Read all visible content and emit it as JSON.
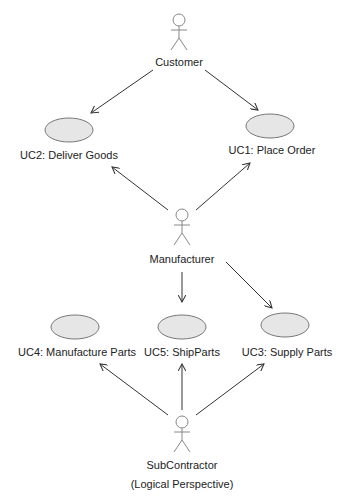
{
  "diagram": {
    "type": "uml-use-case",
    "actors": [
      {
        "id": "customer",
        "label": "Customer"
      },
      {
        "id": "manufacturer",
        "label": "Manufacturer"
      },
      {
        "id": "subcontractor",
        "label": "SubContractor",
        "sublabel": "(Logical Perspective)"
      }
    ],
    "use_cases": [
      {
        "id": "uc1",
        "label": "UC1: Place Order"
      },
      {
        "id": "uc2",
        "label": "UC2: Deliver Goods"
      },
      {
        "id": "uc3",
        "label": "UC3: Supply Parts"
      },
      {
        "id": "uc4",
        "label": "UC4: Manufacture Parts"
      },
      {
        "id": "uc5",
        "label": "UC5: ShipParts"
      }
    ],
    "associations": [
      {
        "from": "customer",
        "to": "uc2"
      },
      {
        "from": "customer",
        "to": "uc1"
      },
      {
        "from": "manufacturer",
        "to": "uc2"
      },
      {
        "from": "manufacturer",
        "to": "uc1"
      },
      {
        "from": "manufacturer",
        "to": "uc5"
      },
      {
        "from": "manufacturer",
        "to": "uc3"
      },
      {
        "from": "subcontractor",
        "to": "uc4"
      },
      {
        "from": "subcontractor",
        "to": "uc5"
      },
      {
        "from": "subcontractor",
        "to": "uc3"
      }
    ],
    "colors": {
      "ellipse_fill": "#e6e6e6",
      "ellipse_stroke": "#777777",
      "line": "#333333",
      "actor": "#888888"
    }
  }
}
